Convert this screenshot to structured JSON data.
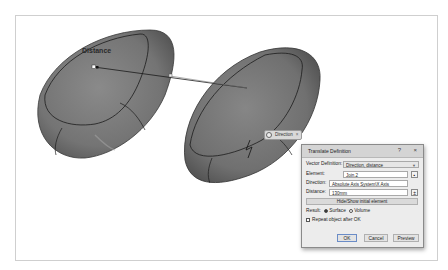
{
  "viewport": {
    "annotation_label": "Distance",
    "direction_tag": {
      "label": "Direction",
      "close_glyph": "×"
    }
  },
  "dialog": {
    "title": "Translate Definition",
    "help_glyph": "?",
    "close_glyph": "×",
    "vector_definition": {
      "label": "Vector Definition:",
      "value": "Direction, distance"
    },
    "element": {
      "label": "Element:",
      "value": "Join.2"
    },
    "direction": {
      "label": "Direction:",
      "value": "Absolute Axis System\\X Axis"
    },
    "distance": {
      "label": "Distance:",
      "value": "130mm"
    },
    "hide_show_label": "Hide/Show initial element",
    "result": {
      "label": "Result:",
      "options": [
        "Surface",
        "Volume"
      ],
      "selected": "Surface"
    },
    "repeat_label": "Repeat object after OK",
    "buttons": {
      "ok": "OK",
      "cancel": "Cancel",
      "preview": "Preview"
    }
  }
}
